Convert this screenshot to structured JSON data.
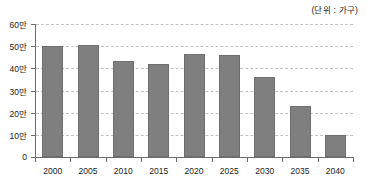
{
  "caption": {
    "unit_label": "(단위 : 가구)"
  },
  "chart_data": {
    "type": "bar",
    "title": "",
    "subtitle": "",
    "xlabel": "",
    "ylabel": "",
    "unit_note": "(단위 : 가구)",
    "categories": [
      "2000",
      "2005",
      "2010",
      "2015",
      "2020",
      "2025",
      "2030",
      "2035",
      "2040"
    ],
    "values": [
      50.3,
      50.6,
      43.5,
      42.0,
      46.5,
      46.2,
      36.0,
      22.8,
      10.0
    ],
    "value_unit": "만",
    "values_in_households": [
      503000,
      506000,
      435000,
      420000,
      465000,
      462000,
      360000,
      228000,
      100000
    ],
    "ylim": [
      0,
      60
    ],
    "ytick_values": [
      0,
      10,
      20,
      30,
      40,
      50,
      60
    ],
    "ytick_labels": [
      "0",
      "10만",
      "20만",
      "30만",
      "40만",
      "50만",
      "60만"
    ],
    "grid": true,
    "grid_style": "dashed-horizontal",
    "legend": null,
    "legend_position": "none",
    "series": [
      {
        "name": "",
        "color": "#7f7f7f",
        "values": [
          50.3,
          50.6,
          43.5,
          42.0,
          46.5,
          46.2,
          36.0,
          22.8,
          10.0
        ]
      }
    ]
  },
  "colors": {
    "bar_fill": "#7f7f7f",
    "bar_stroke": "#6e6e6e",
    "axis": "#6b6b6b",
    "grid": "#c3c3c3",
    "text": "#1a1a1a",
    "background": "#ffffff"
  }
}
